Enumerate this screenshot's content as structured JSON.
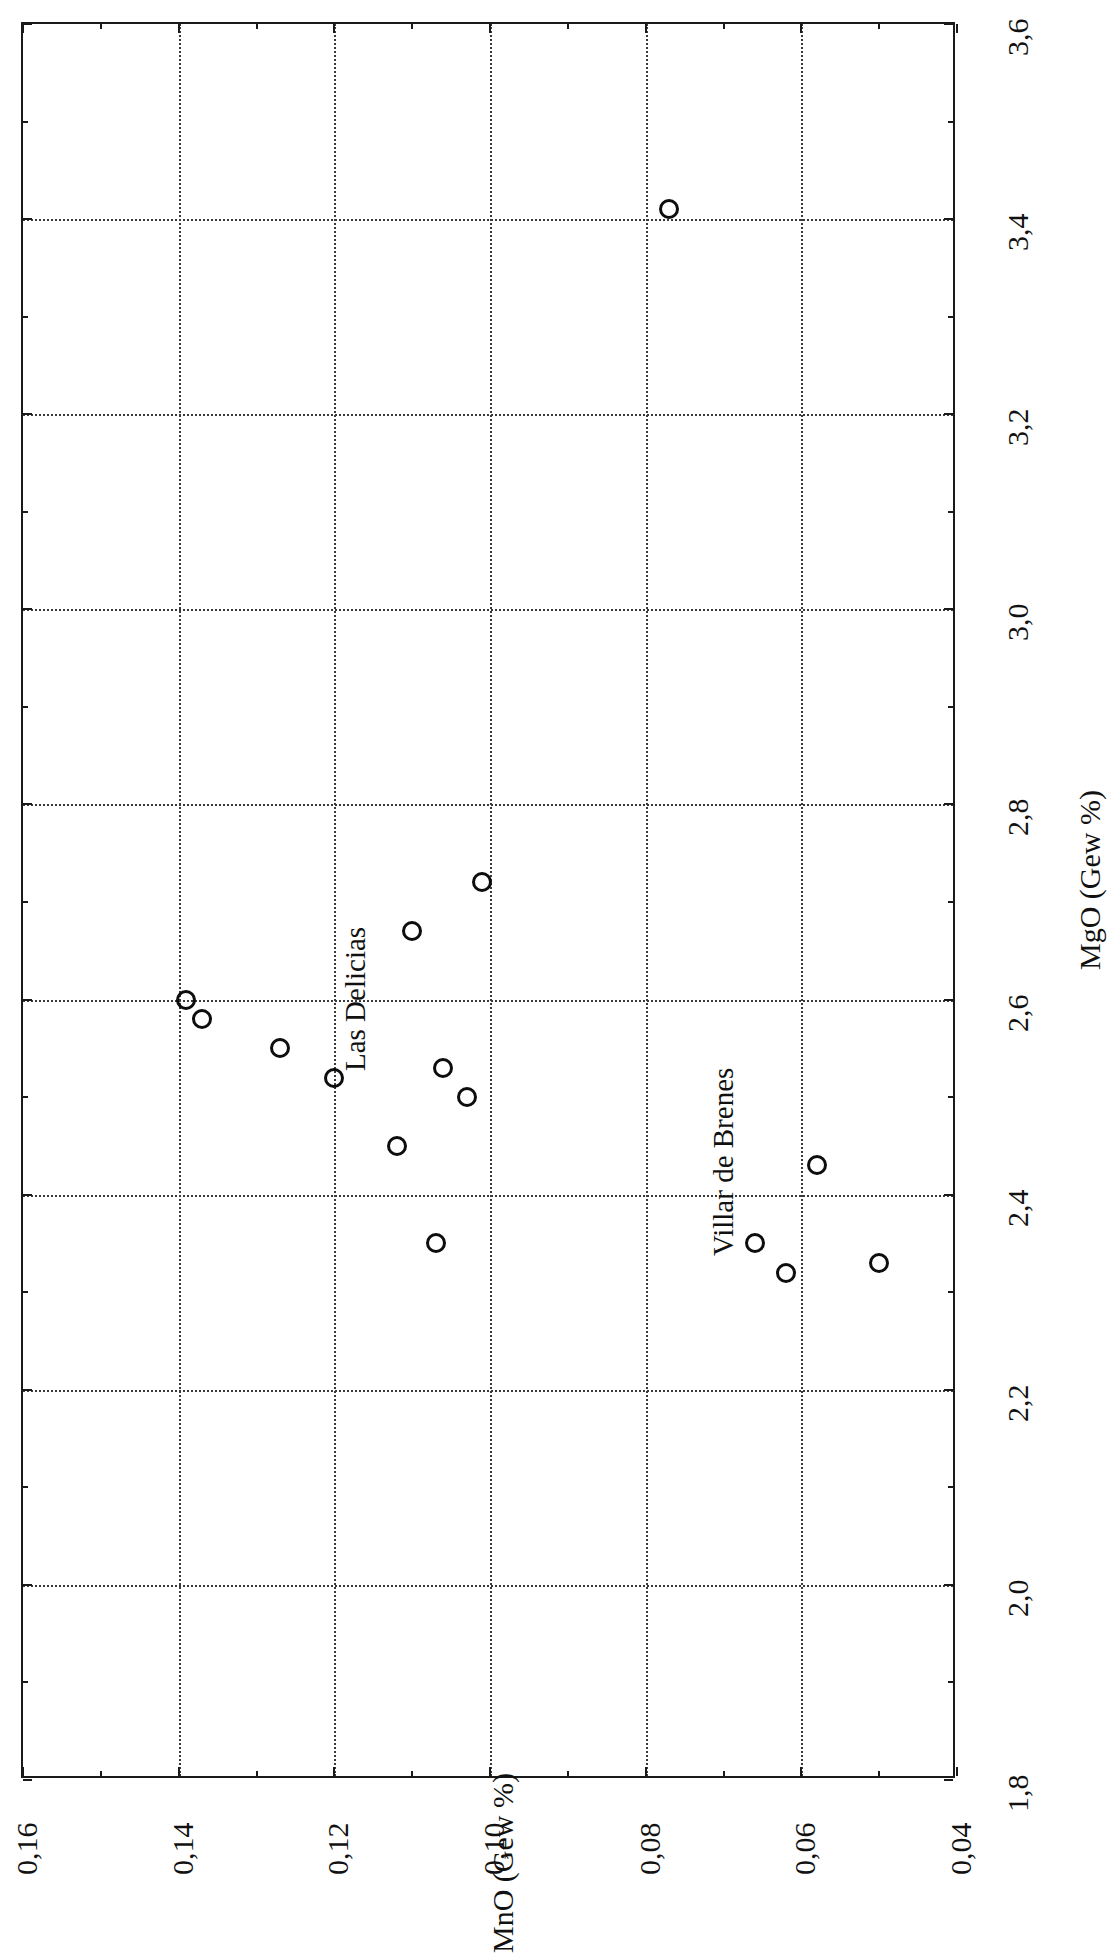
{
  "figure": {
    "orientation": "rotated-90-clockwise",
    "background_color": "#ffffff",
    "ink_color": "#111111",
    "grid_color": "#3a3a3a"
  },
  "axes": {
    "x": {
      "title": "MgO (Gew %)",
      "tick_labels": [
        "1,8",
        "2,0",
        "2,2",
        "2,4",
        "2,6",
        "2,8",
        "3,0",
        "3,2",
        "3,4",
        "3,6"
      ],
      "min": 1.8,
      "max": 3.6,
      "major_step": 0.2,
      "minor_step": 0.1
    },
    "y": {
      "title": "MnO (Gew %)",
      "tick_labels": [
        "0,04",
        "0,06",
        "0,08",
        "0,10",
        "0,12",
        "0,14",
        "0,16"
      ],
      "min": 0.04,
      "max": 0.16,
      "major_step": 0.02,
      "minor_step": 0.01
    }
  },
  "annotations": [
    {
      "text": "Las Delicias",
      "name": "annotation-las-delicias"
    },
    {
      "text": "Villar de Brenes",
      "name": "annotation-villar-de-brenes"
    }
  ],
  "chart_data": {
    "type": "scatter",
    "title": "",
    "xlabel": "MgO (Gew %)",
    "ylabel": "MnO (Gew %)",
    "xlim": [
      1.8,
      3.6
    ],
    "ylim": [
      0.04,
      0.16
    ],
    "grid": true,
    "legend": "none",
    "marker": "open-circle",
    "annotations": [
      {
        "label": "Las Delicias",
        "x": 2.62,
        "y": 0.119
      },
      {
        "label": "Villar de Brenes",
        "x": 2.41,
        "y": 0.072
      }
    ],
    "series": [
      {
        "name": "Las Delicias",
        "points": [
          {
            "x": 3.41,
            "y": 0.077
          },
          {
            "x": 2.72,
            "y": 0.101
          },
          {
            "x": 2.67,
            "y": 0.11
          },
          {
            "x": 2.6,
            "y": 0.139
          },
          {
            "x": 2.58,
            "y": 0.137
          },
          {
            "x": 2.55,
            "y": 0.127
          },
          {
            "x": 2.52,
            "y": 0.12
          },
          {
            "x": 2.53,
            "y": 0.106
          },
          {
            "x": 2.5,
            "y": 0.103
          },
          {
            "x": 2.45,
            "y": 0.112
          },
          {
            "x": 2.35,
            "y": 0.107
          }
        ]
      },
      {
        "name": "Villar de Brenes",
        "points": [
          {
            "x": 2.43,
            "y": 0.058
          },
          {
            "x": 2.35,
            "y": 0.066
          },
          {
            "x": 2.32,
            "y": 0.062
          },
          {
            "x": 2.33,
            "y": 0.05
          }
        ]
      }
    ]
  }
}
